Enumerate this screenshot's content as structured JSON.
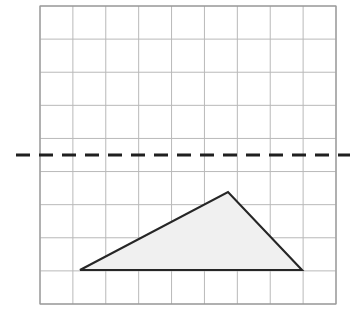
{
  "page": {
    "width": 351,
    "height": 318,
    "background": "#ffffff"
  },
  "question_label": {
    "text": ")",
    "note": "partially cropped question-number bracket at left edge"
  },
  "grid": {
    "x": 40,
    "y": 6,
    "width": 296,
    "height": 298,
    "columns": 9,
    "rows": 9,
    "cell_width": 32.9,
    "cell_height": 33.1,
    "line_color": "#b9b9b9",
    "border_color": "#9a9a9a",
    "line_width": 1
  },
  "mirror_line": {
    "name": "mirror-line",
    "orientation": "horizontal",
    "y": 155,
    "x_start": 16,
    "x_end": 350,
    "color": "#1f1f1f",
    "width": 3,
    "dash": "14 9",
    "label": "dashed mirror line"
  },
  "chart_data": {
    "type": "scatter",
    "xlabel": "",
    "ylabel": "",
    "grid": true,
    "xlim": [
      0,
      9
    ],
    "ylim": [
      0,
      9
    ],
    "categories": [
      "A",
      "B",
      "C"
    ],
    "annotations": [
      "Grid is 9 columns by 9 rows of unit squares",
      "Horizontal dashed mirror line lies on the gridline 4.5 units from the top",
      "Shaded triangle sits below the mirror line"
    ],
    "series": [
      {
        "name": "triangle-vertices-pixels",
        "values": [
          {
            "label": "A",
            "x": 80,
            "y": 270
          },
          {
            "label": "B",
            "x": 228,
            "y": 192
          },
          {
            "label": "C",
            "x": 302,
            "y": 270
          }
        ]
      },
      {
        "name": "triangle-vertices-grid-units",
        "values": [
          {
            "label": "A",
            "x": 1.2,
            "y": 1.0
          },
          {
            "label": "B",
            "x": 5.7,
            "y": 3.4
          },
          {
            "label": "C",
            "x": 8.0,
            "y": 1.0
          }
        ]
      }
    ]
  },
  "triangle": {
    "name": "shaded-triangle",
    "points": "80,270 228,192 302,270",
    "fill": "#f0f0f0",
    "stroke": "#262626",
    "stroke_width": 2.1
  }
}
